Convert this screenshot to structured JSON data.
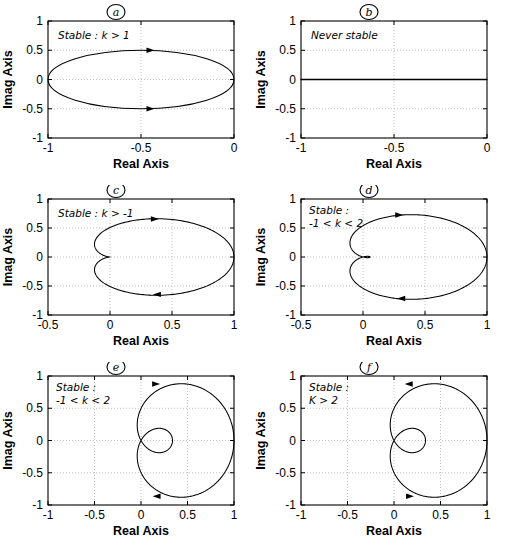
{
  "figure": {
    "kind": "nyquist-plot-grid",
    "rows": 3,
    "cols": 2,
    "background": "#ffffff",
    "curve_color": "#000000",
    "grid_color": "#b0b0b0",
    "axis_color": "#000000"
  },
  "chart_data": [
    {
      "type": "line",
      "id": "a",
      "panel_label": "a",
      "annotation": "Stable : k > 1",
      "title": "",
      "xlabel": "Real Axis",
      "ylabel": "Imag Axis",
      "xlim": [
        -1,
        0
      ],
      "ylim": [
        -1,
        1
      ],
      "xticks": [
        -1,
        -0.5,
        0
      ],
      "xticklabels": [
        "-1",
        "-0.5",
        "0"
      ],
      "yticks": [
        -1,
        -0.5,
        0,
        0.5,
        1
      ],
      "yticklabels": [
        "-1",
        "-0.5",
        "0",
        "0.5",
        "1"
      ],
      "grid": true,
      "shape": "ellipse",
      "ellipse": {
        "cx": -0.5,
        "cy": 0.0,
        "rx": 0.5,
        "ry": 0.5
      },
      "arrows": [
        {
          "x": -0.45,
          "y": 0.5,
          "dir": "right"
        },
        {
          "x": -0.45,
          "y": -0.5,
          "dir": "right"
        }
      ]
    },
    {
      "type": "line",
      "id": "b",
      "panel_label": "b",
      "annotation": "Never stable",
      "title": "",
      "xlabel": "Real Axis",
      "ylabel": "Imag Axis",
      "xlim": [
        -1,
        0
      ],
      "ylim": [
        -1,
        1
      ],
      "xticks": [
        -1,
        -0.5,
        0
      ],
      "xticklabels": [
        "-1",
        "-0.5",
        "0"
      ],
      "yticks": [
        -1,
        -0.5,
        0,
        0.5,
        1
      ],
      "yticklabels": [
        "-1",
        "-0.5",
        "0",
        "0.5",
        "1"
      ],
      "grid": true,
      "shape": "horizontal-line",
      "line_y": 0.0,
      "arrows": []
    },
    {
      "type": "line",
      "id": "c",
      "panel_label": "c",
      "annotation": "Stable :\nk > -1",
      "annotation_line1": "Stable :",
      "annotation_line2": "k > -1",
      "title": "",
      "xlabel": "Real Axis",
      "ylabel": "Imag Axis",
      "xlim": [
        -0.5,
        1
      ],
      "ylim": [
        -1,
        1
      ],
      "xticks": [
        -0.5,
        0,
        0.5,
        1
      ],
      "xticklabels": [
        "-0.5",
        "0",
        "0.5",
        "1"
      ],
      "yticks": [
        -1,
        -0.5,
        0,
        0.5,
        1
      ],
      "yticklabels": [
        "-1",
        "-0.5",
        "0",
        "0.5",
        "1"
      ],
      "grid": true,
      "shape": "cardioid-cusp",
      "cusp_point": [
        0.0,
        0.0
      ],
      "right_extent": 1.0,
      "left_extent": -0.13,
      "top_extent": 0.66,
      "arrows": [
        {
          "x": 0.36,
          "y": 0.655,
          "dir": "right"
        },
        {
          "x": 0.38,
          "y": -0.645,
          "dir": "left"
        }
      ]
    },
    {
      "type": "line",
      "id": "d",
      "panel_label": "d",
      "annotation_line1": "Stable :",
      "annotation_line2": "-1 < k < 2",
      "title": "",
      "xlabel": "Real Axis",
      "ylabel": "Imag Axis",
      "xlim": [
        -0.5,
        1
      ],
      "ylim": [
        -1,
        1
      ],
      "xticks": [
        -0.5,
        0,
        0.5,
        1
      ],
      "xticklabels": [
        "-0.5",
        "0",
        "0.5",
        "1"
      ],
      "yticks": [
        -1,
        -0.5,
        0,
        0.5,
        1
      ],
      "yticklabels": [
        "-1",
        "-0.5",
        "0",
        "0.5",
        "1"
      ],
      "grid": true,
      "shape": "cardioid-tiny-loop",
      "loop_center": [
        -0.055,
        0.0
      ],
      "loop_rx": 0.045,
      "loop_ry": 0.022,
      "right_extent": 1.0,
      "left_extent": -0.22,
      "top_extent": 0.73,
      "arrows": [
        {
          "x": 0.29,
          "y": 0.725,
          "dir": "right"
        },
        {
          "x": 0.31,
          "y": -0.715,
          "dir": "left"
        }
      ]
    },
    {
      "type": "line",
      "id": "e",
      "panel_label": "e",
      "annotation_line1": "Stable :",
      "annotation_line2": "-1 < k < 2",
      "title": "",
      "xlabel": "Real Axis",
      "ylabel": "Imag Axis",
      "xlim": [
        -1,
        1
      ],
      "ylim": [
        -1,
        1
      ],
      "xticks": [
        -1,
        -0.5,
        0,
        0.5,
        1
      ],
      "xticklabels": [
        "-1",
        "-0.5",
        "0",
        "0.5",
        "1"
      ],
      "yticks": [
        -1,
        -0.5,
        0,
        0.5,
        1
      ],
      "yticklabels": [
        "-1",
        "-0.5",
        "0",
        "0.5",
        "1"
      ],
      "grid": true,
      "shape": "limacon-inner-loop",
      "outer": {
        "left": -0.62,
        "right": 1.0,
        "top": 0.88,
        "bottom": -0.88
      },
      "inner_loop": {
        "cx": -0.21,
        "cy": 0.0,
        "rx": 0.3,
        "ry": 0.16
      },
      "crossing": [
        -0.5,
        0.15
      ],
      "arrows": [
        {
          "x": 0.16,
          "y": 0.875,
          "dir": "right"
        },
        {
          "x": 0.17,
          "y": -0.865,
          "dir": "left"
        }
      ]
    },
    {
      "type": "line",
      "id": "f",
      "panel_label": "f",
      "annotation_line1": "Stable :",
      "annotation_line2": "K > 2",
      "title": "",
      "xlabel": "Real Axis",
      "ylabel": "Imag Axis",
      "xlim": [
        -1,
        1
      ],
      "ylim": [
        -1,
        1
      ],
      "xticks": [
        -1,
        -0.5,
        0,
        0.5,
        1
      ],
      "xticklabels": [
        "-1",
        "-0.5",
        "0",
        "0.5",
        "1"
      ],
      "yticks": [
        -1,
        -0.5,
        0,
        0.5,
        1
      ],
      "yticklabels": [
        "-1",
        "-0.5",
        "0",
        "0.5",
        "1"
      ],
      "grid": true,
      "shape": "limacon-inner-loop",
      "outer": {
        "left": -0.62,
        "right": 1.0,
        "top": 0.88,
        "bottom": -0.88
      },
      "inner_loop": {
        "cx": -0.21,
        "cy": 0.0,
        "rx": 0.3,
        "ry": 0.16
      },
      "crossing": [
        -0.5,
        0.15
      ],
      "arrows": [
        {
          "x": 0.16,
          "y": 0.875,
          "dir": "left"
        },
        {
          "x": 0.17,
          "y": -0.865,
          "dir": "right"
        }
      ]
    }
  ]
}
